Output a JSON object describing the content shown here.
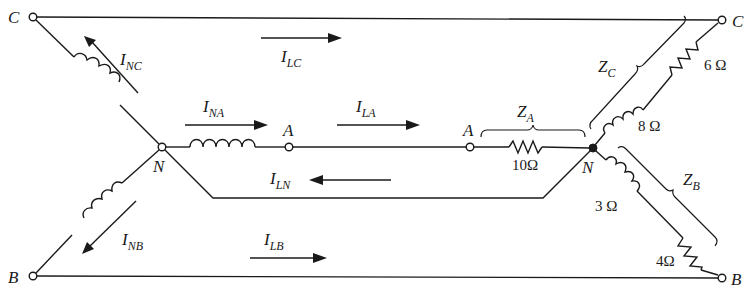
{
  "diagram": {
    "source": {
      "neutral": "N",
      "terminals": [
        "A",
        "B",
        "C"
      ],
      "elements": {
        "phase_a": "inductor",
        "phase_b": "inductor",
        "phase_c": "inductor"
      }
    },
    "nodes": {
      "c_left": "C",
      "c_right": "C",
      "b_left": "B",
      "b_right": "B",
      "a_source": "A",
      "a_load": "A",
      "n_source": "N",
      "n_load": "N"
    },
    "currents": {
      "i_nc": {
        "main": "I",
        "sub": "NC"
      },
      "i_na": {
        "main": "I",
        "sub": "NA"
      },
      "i_nb": {
        "main": "I",
        "sub": "NB"
      },
      "i_lc": {
        "main": "I",
        "sub": "LC"
      },
      "i_la": {
        "main": "I",
        "sub": "LA"
      },
      "i_ln": {
        "main": "I",
        "sub": "LN"
      },
      "i_lb": {
        "main": "I",
        "sub": "LB"
      }
    },
    "impedances": {
      "z_a": {
        "main": "Z",
        "sub": "A",
        "resistor": "10Ω"
      },
      "z_b": {
        "main": "Z",
        "sub": "B",
        "inductor": "3 Ω",
        "resistor": "4Ω"
      },
      "z_c": {
        "main": "Z",
        "sub": "C",
        "inductor": "8 Ω",
        "resistor": "6 Ω"
      }
    },
    "colors": {
      "ink": "#1a1a1a",
      "background": "#ffffff"
    }
  }
}
